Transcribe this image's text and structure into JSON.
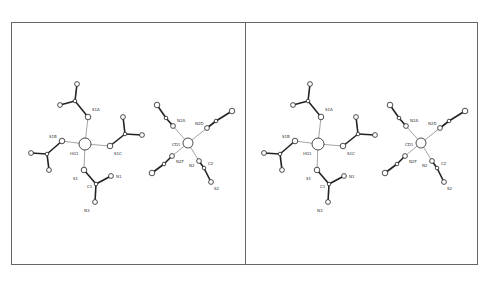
{
  "figure": {
    "title": "",
    "panels": [
      "left-stereo-view",
      "right-stereo-view"
    ],
    "stereo_offset_x": 233
  },
  "molecules": {
    "hg": {
      "labels": {
        "S1A": "S1A",
        "S1B": "S1B",
        "HG1": "HG1",
        "S1C": "S1C",
        "S1": "S1",
        "C1": "C1",
        "N1": "N1",
        "N3": "N3"
      }
    },
    "cd": {
      "labels": {
        "N2A": "N2A",
        "N2D": "N2D",
        "CD1": "CD1",
        "N2F": "N2F",
        "N2": "N2",
        "C2": "C2",
        "S2": "S2"
      }
    }
  }
}
